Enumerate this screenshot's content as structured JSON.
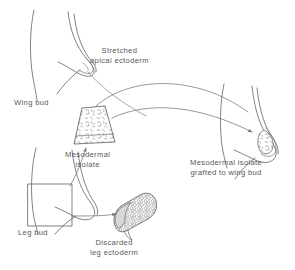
{
  "figure": {
    "background_color": "#ffffff",
    "line_color": "#6b6b70",
    "text_color": "#57565a"
  },
  "labels": {
    "wing_bud": "Wing bud",
    "stretched_apical_ectoderm_line1": "Stretched",
    "stretched_apical_ectoderm_line2": "apical ectoderm",
    "mesodermal_isolate_line1": "Mesodermal",
    "mesodermal_isolate_line2": "isolate",
    "leg_bud": "Leg bud",
    "discarded_leg_ectoderm_line1": "Discarded",
    "discarded_leg_ectoderm_line2": "leg ectoderm",
    "grafted_line1": "Mesodermal isolate",
    "grafted_line2": "grafted to wing bud"
  },
  "structures": {
    "wing_bud_upper_left": "limb bud outline with stretched pointed apex",
    "wing_bud_right": "limb bud outline with grafted stippled tissue at apex",
    "leg_bud_lower_left": "limb bud outline with square excision box",
    "mesodermal_isolate_block": "stippled trapezoid tissue block",
    "discarded_leg_ectoderm_block": "tilted cellular ectoderm sheath"
  },
  "arrows": [
    {
      "name": "isolate-to-wingbud",
      "from": "mesodermal-isolate",
      "to": "wing-bud-right-apex"
    },
    {
      "name": "legbud-to-isolate",
      "from": "leg-bud-excision-box",
      "to": "mesodermal-isolate"
    },
    {
      "name": "legbud-to-discarded",
      "from": "leg-bud-excision-box",
      "to": "discarded-leg-ectoderm"
    }
  ]
}
